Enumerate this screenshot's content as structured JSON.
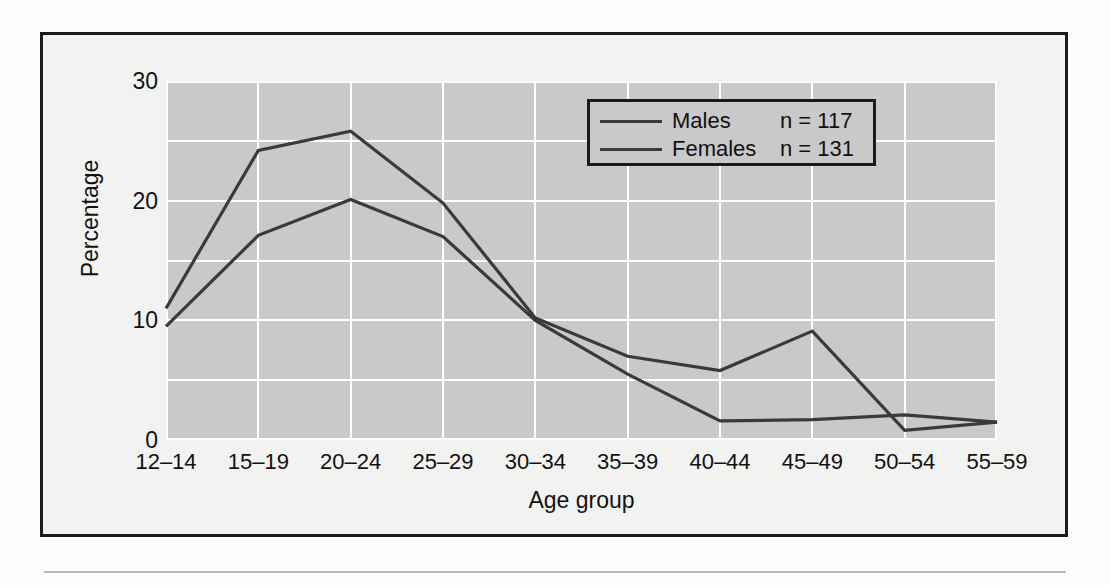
{
  "chart_data": {
    "type": "line",
    "title": "",
    "xlabel": "Age group",
    "ylabel": "Percentage",
    "categories": [
      "12–14",
      "15–19",
      "20–24",
      "25–29",
      "30–34",
      "35–39",
      "40–44",
      "45–49",
      "50–54",
      "55–59"
    ],
    "series": [
      {
        "name": "Males",
        "n_label": "n = 117",
        "color": "#3a3a3a",
        "values": [
          11,
          24.2,
          25.8,
          19.8,
          10.2,
          7,
          5.8,
          9.1,
          0.8,
          1.5
        ]
      },
      {
        "name": "Females",
        "n_label": "n = 131",
        "color": "#3a3a3a",
        "values": [
          9.5,
          17.1,
          20.1,
          17,
          10,
          5.5,
          1.6,
          1.7,
          2.1,
          1.5
        ]
      }
    ],
    "ylim": [
      0,
      30
    ],
    "yticks": [
      0,
      10,
      20,
      30
    ],
    "ygridlines": [
      0,
      5,
      10,
      15,
      20,
      25,
      30
    ],
    "grid": true,
    "legend_position": "top-right",
    "plot_background": "#c9c9c9",
    "gridline_color": "#ffffff"
  },
  "axis": {
    "yticks": [
      "0",
      "10",
      "20",
      "30"
    ],
    "ylabel": "Percentage",
    "xlabel": "Age group",
    "xticks": [
      "12–14",
      "15–19",
      "20–24",
      "25–29",
      "30–34",
      "35–39",
      "40–44",
      "45–49",
      "50–54",
      "55–59"
    ]
  },
  "legend": {
    "rows": [
      {
        "name": "Males",
        "n": "n = 117"
      },
      {
        "name": "Females",
        "n": "n = 131"
      }
    ]
  }
}
